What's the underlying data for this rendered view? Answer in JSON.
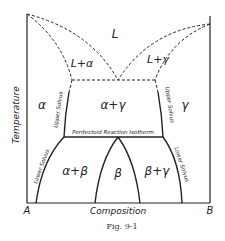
{
  "figure": {
    "caption": "Fig. 9-1",
    "axes": {
      "x_label": "Composition",
      "y_label": "Temperature",
      "x_left": "A",
      "x_right": "B"
    },
    "regions": {
      "liquid": "L",
      "liquid_alpha": "L+α",
      "liquid_gamma": "L+γ",
      "alpha": "α",
      "alpha_gamma": "α+γ",
      "gamma": "γ",
      "alpha_beta": "α+β",
      "beta": "β",
      "beta_gamma": "β+γ"
    },
    "line_labels": {
      "upper_solvus_left": "Upper Solvus",
      "upper_solvus_right": "Upper Solvus",
      "peritectoid": "Peritectoid Reaction Isotherm",
      "lower_solvus_left": "Lower Solvus",
      "lower_solvus_right": "Lower Solvus"
    },
    "colors": {
      "line": "#222222",
      "background": "#ffffff"
    }
  }
}
